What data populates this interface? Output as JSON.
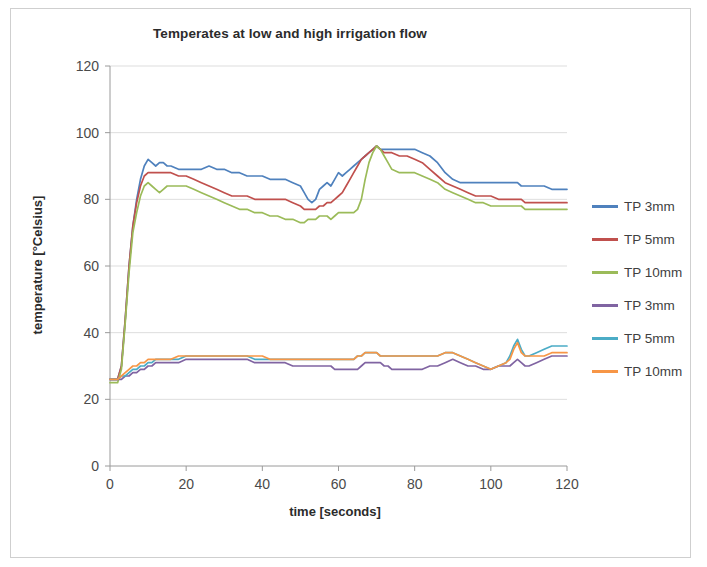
{
  "chart_data": {
    "type": "line",
    "title": "Temperates at low and high irrigation flow",
    "xlabel": "time [seconds]",
    "ylabel": "temperature [°Celsius]",
    "xlim": [
      0,
      120
    ],
    "ylim": [
      0,
      120
    ],
    "xticks": [
      0,
      20,
      40,
      60,
      80,
      100,
      120
    ],
    "yticks": [
      0,
      20,
      40,
      60,
      80,
      100,
      120
    ],
    "grid": "horizontal",
    "legend_position": "right",
    "x": [
      0,
      2,
      3,
      4,
      5,
      6,
      7,
      8,
      9,
      10,
      11,
      12,
      13,
      14,
      15,
      16,
      18,
      20,
      22,
      24,
      26,
      28,
      30,
      32,
      34,
      36,
      38,
      40,
      42,
      44,
      46,
      48,
      50,
      51,
      52,
      53,
      54,
      55,
      56,
      57,
      58,
      59,
      60,
      61,
      62,
      63,
      64,
      65,
      66,
      67,
      68,
      69,
      70,
      71,
      72,
      73,
      74,
      76,
      78,
      80,
      82,
      84,
      86,
      88,
      90,
      92,
      94,
      96,
      98,
      100,
      102,
      104,
      105,
      106,
      107,
      108,
      109,
      110,
      112,
      114,
      116,
      118,
      120
    ],
    "series": [
      {
        "name": "TP 3mm",
        "color": "#4f81bd",
        "group": "high-flow",
        "values": [
          26,
          26,
          30,
          44,
          60,
          72,
          80,
          86,
          90,
          92,
          91,
          90,
          91,
          91,
          90,
          90,
          89,
          89,
          89,
          89,
          90,
          89,
          89,
          88,
          88,
          87,
          87,
          87,
          86,
          86,
          86,
          85,
          84,
          82,
          80,
          79,
          80,
          83,
          84,
          85,
          84,
          86,
          88,
          87,
          88,
          89,
          90,
          91,
          92,
          93,
          94,
          95,
          96,
          95,
          95,
          95,
          95,
          95,
          95,
          95,
          94,
          93,
          91,
          88,
          86,
          85,
          85,
          85,
          85,
          85,
          85,
          85,
          85,
          85,
          85,
          84,
          84,
          84,
          84,
          84,
          83,
          83,
          83
        ]
      },
      {
        "name": "TP 5mm",
        "color": "#c0504d",
        "group": "high-flow",
        "values": [
          26,
          26,
          30,
          44,
          60,
          72,
          79,
          84,
          87,
          88,
          88,
          88,
          88,
          88,
          88,
          88,
          87,
          87,
          86,
          85,
          84,
          83,
          82,
          81,
          81,
          81,
          80,
          80,
          80,
          80,
          80,
          79,
          78,
          77,
          77,
          77,
          77,
          78,
          78,
          79,
          79,
          80,
          81,
          82,
          84,
          86,
          88,
          90,
          92,
          93,
          94,
          95,
          96,
          95,
          94,
          94,
          94,
          93,
          93,
          92,
          91,
          89,
          87,
          85,
          84,
          83,
          82,
          81,
          81,
          81,
          80,
          80,
          80,
          80,
          80,
          80,
          79,
          79,
          79,
          79,
          79,
          79,
          79
        ]
      },
      {
        "name": "TP 10mm",
        "color": "#9bbb59",
        "group": "high-flow",
        "values": [
          25,
          25,
          29,
          43,
          58,
          70,
          76,
          81,
          84,
          85,
          84,
          83,
          82,
          83,
          84,
          84,
          84,
          84,
          83,
          82,
          81,
          80,
          79,
          78,
          77,
          77,
          76,
          76,
          75,
          75,
          74,
          74,
          73,
          73,
          74,
          74,
          74,
          75,
          75,
          75,
          74,
          75,
          76,
          76,
          76,
          76,
          76,
          77,
          80,
          86,
          91,
          94,
          96,
          95,
          93,
          91,
          89,
          88,
          88,
          88,
          87,
          86,
          85,
          83,
          82,
          81,
          80,
          79,
          79,
          78,
          78,
          78,
          78,
          78,
          78,
          78,
          77,
          77,
          77,
          77,
          77,
          77,
          77
        ]
      },
      {
        "name": "TP 3mm",
        "color": "#8064a2",
        "group": "low-flow",
        "values": [
          26,
          26,
          26,
          27,
          27,
          28,
          28,
          29,
          29,
          30,
          30,
          31,
          31,
          31,
          31,
          31,
          31,
          32,
          32,
          32,
          32,
          32,
          32,
          32,
          32,
          32,
          31,
          31,
          31,
          31,
          31,
          30,
          30,
          30,
          30,
          30,
          30,
          30,
          30,
          30,
          30,
          29,
          29,
          29,
          29,
          29,
          29,
          29,
          30,
          31,
          31,
          31,
          31,
          31,
          30,
          30,
          29,
          29,
          29,
          29,
          29,
          30,
          30,
          31,
          32,
          31,
          30,
          30,
          29,
          29,
          30,
          30,
          30,
          31,
          32,
          31,
          30,
          30,
          31,
          32,
          33,
          33,
          33
        ]
      },
      {
        "name": "TP 5mm",
        "color": "#4bacc6",
        "group": "low-flow",
        "values": [
          26,
          26,
          27,
          27,
          28,
          29,
          29,
          30,
          30,
          31,
          31,
          32,
          32,
          32,
          32,
          32,
          32,
          33,
          33,
          33,
          33,
          33,
          33,
          33,
          33,
          33,
          32,
          32,
          32,
          32,
          32,
          32,
          32,
          32,
          32,
          32,
          32,
          32,
          32,
          32,
          32,
          32,
          32,
          32,
          32,
          32,
          32,
          33,
          33,
          34,
          34,
          34,
          34,
          33,
          33,
          33,
          33,
          33,
          33,
          33,
          33,
          33,
          33,
          34,
          34,
          33,
          32,
          31,
          30,
          29,
          30,
          31,
          33,
          36,
          38,
          35,
          33,
          33,
          34,
          35,
          36,
          36,
          36
        ]
      },
      {
        "name": "TP 10mm",
        "color": "#f79646",
        "group": "low-flow",
        "values": [
          26,
          26,
          27,
          28,
          29,
          30,
          30,
          31,
          31,
          32,
          32,
          32,
          32,
          32,
          32,
          32,
          33,
          33,
          33,
          33,
          33,
          33,
          33,
          33,
          33,
          33,
          33,
          33,
          32,
          32,
          32,
          32,
          32,
          32,
          32,
          32,
          32,
          32,
          32,
          32,
          32,
          32,
          32,
          32,
          32,
          32,
          32,
          33,
          33,
          34,
          34,
          34,
          34,
          33,
          33,
          33,
          33,
          33,
          33,
          33,
          33,
          33,
          33,
          34,
          34,
          33,
          32,
          31,
          30,
          29,
          30,
          31,
          32,
          35,
          37,
          34,
          33,
          33,
          33,
          33,
          34,
          34,
          34
        ]
      }
    ]
  }
}
